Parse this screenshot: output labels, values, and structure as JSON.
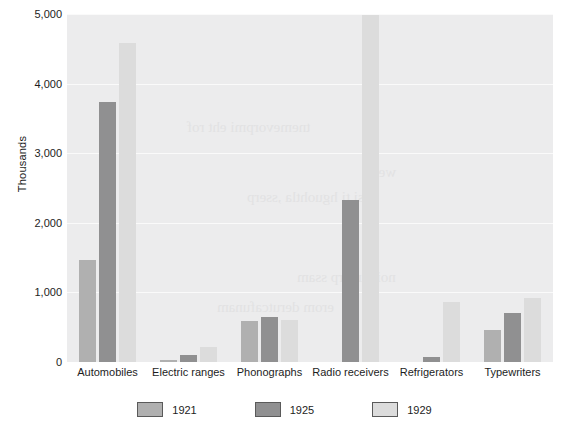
{
  "chart_data": {
    "type": "bar",
    "title": "",
    "xlabel": "",
    "ylabel": "Thousands",
    "ylim": [
      0,
      5000
    ],
    "ytick_labels": [
      "0",
      "1,000",
      "2,000",
      "3,000",
      "4,000",
      "5,000"
    ],
    "ytick_values": [
      0,
      1000,
      2000,
      3000,
      4000,
      5000
    ],
    "grid": true,
    "legend_position": "bottom",
    "categories": [
      "Automobiles",
      "Electric ranges",
      "Phonographs",
      "Radio receivers",
      "Refrigerators",
      "Typewriters"
    ],
    "series": [
      {
        "name": "1921",
        "color": "#b0b0b0",
        "values": [
          1468,
          35,
          596,
          0,
          5,
          456
        ]
      },
      {
        "name": "1925",
        "color": "#909091",
        "values": [
          3735,
          95,
          643,
          2330,
          75,
          707
        ]
      },
      {
        "name": "1929",
        "color": "#dcdcdc",
        "values": [
          4587,
          212,
          601,
          4980,
          860,
          923
        ]
      }
    ]
  },
  "background": {
    "plot_fill": "#ececed",
    "gridline_color": "#fafafa",
    "page_fill": "#ffffff"
  },
  "bleed_text": [
    "weiv",
    "si ti hguohtla ,sserp",
    "tnemevorpmi eht rof",
    "noitcudorp ssam",
    "erom derutcafunam"
  ]
}
